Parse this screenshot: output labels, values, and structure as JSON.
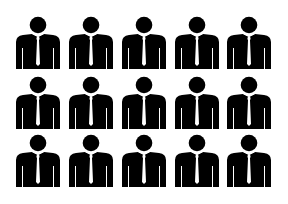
{
  "image": {
    "description": "Grid of businessman pictogram icons",
    "background": "#ffffff",
    "icon_color": "#000000",
    "tie_color": "#ffffff",
    "icon_name": "businessman-icon",
    "rows": 3,
    "columns": 5,
    "column_centers": [
      38,
      91,
      144,
      197,
      249
    ],
    "row_tops": [
      16,
      76,
      134
    ]
  }
}
